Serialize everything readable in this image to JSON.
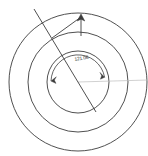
{
  "figure": {
    "kind": "engineering-drawing",
    "title": "",
    "background_color": "#ffffff",
    "stroke_color": "#3c3c3c",
    "faint_stroke_color": "#bdbdbd",
    "center": {
      "x": 78,
      "y": 82
    }
  },
  "circles": [
    {
      "name": "outer-circle",
      "radius": 69,
      "stroke": "#3c3c3c"
    },
    {
      "name": "middle-circle",
      "radius": 50,
      "stroke": "#3c3c3c"
    },
    {
      "name": "inner-circle",
      "radius": 31,
      "stroke": "#3c3c3c"
    }
  ],
  "lines": [
    {
      "name": "diagonal-radius-line",
      "x1": 34,
      "y1": 9,
      "x2": 96,
      "y2": 112,
      "stroke": "#3c3c3c"
    },
    {
      "name": "leader-line",
      "x1": 52,
      "y1": 38,
      "x2": 81,
      "y2": 17,
      "stroke": "#3c3c3c"
    },
    {
      "name": "vertical-tick-line",
      "x1": 81,
      "y1": 17,
      "x2": 81,
      "y2": 36,
      "stroke": "#3c3c3c"
    },
    {
      "name": "horizontal-reference-line",
      "x1": 78,
      "y1": 82,
      "x2": 148,
      "y2": 80,
      "stroke": "#bdbdbd"
    }
  ],
  "arrow": {
    "name": "up-arrow-marker",
    "tip": {
      "x": 81,
      "y": 14
    }
  },
  "dimension_arc": {
    "name": "angle-dimension-arc",
    "radius": 27,
    "start_angle_deg": 182,
    "end_angle_deg": 350,
    "stroke": "#3c3c3c",
    "has_start_arrow": true,
    "has_end_arrow": true
  },
  "labels": {
    "angle_value": "121.06",
    "angle_label_position": {
      "x": 74,
      "y": 57
    }
  }
}
